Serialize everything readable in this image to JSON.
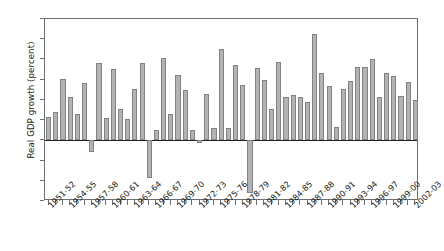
{
  "chart_data": {
    "type": "bar",
    "title": "",
    "xlabel": "",
    "ylabel": "Real GDP growth (percent)",
    "ylim": [
      -6,
      12
    ],
    "ytick_values": [
      12,
      10,
      8,
      6,
      4,
      2,
      0,
      -2,
      -4,
      -6
    ],
    "ytick_labels": [
      "12",
      "10",
      "8",
      "6",
      "4",
      "2",
      "0",
      "-2",
      "-4",
      "-6"
    ],
    "grid": false,
    "legend": "none",
    "bar_color": "#b3b3b3",
    "bar_edge_color": "#808285",
    "axis_color": "#6d6e71",
    "zero_line_color": "#231f20",
    "categories": [
      "1951-52",
      "1952-53",
      "1953-54",
      "1954-55",
      "1955-56",
      "1956-57",
      "1957-58",
      "1958-59",
      "1959-60",
      "1960-61",
      "1961-62",
      "1962-63",
      "1963-64",
      "1964-65",
      "1965-66",
      "1966-67",
      "1967-68",
      "1968-69",
      "1969-70",
      "1970-71",
      "1971-72",
      "1972-73",
      "1973-74",
      "1974-75",
      "1975-76",
      "1976-77",
      "1977-78",
      "1978-79",
      "1979-80",
      "1980-81",
      "1981-82",
      "1982-83",
      "1983-84",
      "1984-85",
      "1985-86",
      "1986-87",
      "1987-88",
      "1988-89",
      "1989-90",
      "1990-91",
      "1991-92",
      "1992-93",
      "1993-94",
      "1994-95",
      "1995-96",
      "1996-97",
      "1997-98",
      "1998-99",
      "1999-00",
      "2000-01",
      "2001-02",
      "2002-03"
    ],
    "values": [
      2.3,
      2.8,
      6.1,
      4.3,
      2.6,
      5.7,
      -1.2,
      7.6,
      2.2,
      7.1,
      3.1,
      2.1,
      5.1,
      7.6,
      -3.7,
      1.0,
      8.1,
      2.6,
      6.5,
      5.0,
      1.0,
      -0.3,
      4.6,
      1.2,
      9.0,
      1.2,
      7.5,
      5.5,
      -5.2,
      7.2,
      6.0,
      3.1,
      7.7,
      4.3,
      4.5,
      4.3,
      3.8,
      10.5,
      6.7,
      5.4,
      1.3,
      5.1,
      5.9,
      7.3,
      7.3,
      8.0,
      4.3,
      6.7,
      6.4,
      4.4,
      5.8,
      4.0
    ],
    "xtick_labels_shown": [
      "1951-52",
      "1954-55",
      "1957-58",
      "1960-61",
      "1963-64",
      "1966-67",
      "1969-70",
      "1972-73",
      "1975-76",
      "1978-79",
      "1981-82",
      "1984-85",
      "1987-88",
      "1990-91",
      "1993-94",
      "1996-97",
      "1999-00",
      "2002-03"
    ],
    "xtick_label_indices": [
      0,
      3,
      6,
      9,
      12,
      15,
      18,
      21,
      24,
      27,
      30,
      33,
      36,
      39,
      42,
      45,
      48,
      51
    ]
  }
}
